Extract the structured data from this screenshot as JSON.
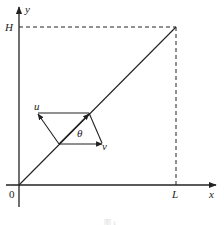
{
  "diagram": {
    "axes": {
      "x_label": "x",
      "y_label": "y",
      "origin_label": "0",
      "x_mark_label": "L",
      "y_mark_label": "H"
    },
    "vectors": {
      "u_label": "u",
      "v_label": "v",
      "angle_label": "θ"
    },
    "caption": "图 1",
    "colors": {
      "stroke": "#222222",
      "background": "#ffffff"
    }
  }
}
